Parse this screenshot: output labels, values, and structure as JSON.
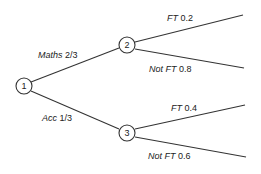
{
  "diagram": {
    "type": "probability-tree",
    "nodes": [
      {
        "id": "1",
        "label": "1",
        "x": 24,
        "y": 86
      },
      {
        "id": "2",
        "label": "2",
        "x": 127,
        "y": 45
      },
      {
        "id": "3",
        "label": "3",
        "x": 127,
        "y": 133
      }
    ],
    "branches": [
      {
        "from": "1",
        "to": "2",
        "name": "Maths",
        "prob": "2/3"
      },
      {
        "from": "1",
        "to": "3",
        "name": "Acc",
        "prob": "1/3"
      },
      {
        "from": "2",
        "name": "FT",
        "prob": "0.2"
      },
      {
        "from": "2",
        "name": "Not FT",
        "prob": "0.8"
      },
      {
        "from": "3",
        "name": "FT",
        "prob": "0.4"
      },
      {
        "from": "3",
        "name": "Not FT",
        "prob": "0.6"
      }
    ]
  }
}
